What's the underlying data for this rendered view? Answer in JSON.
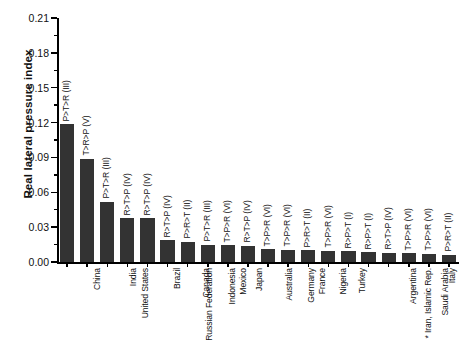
{
  "chart_data": {
    "type": "bar",
    "title": "",
    "xlabel": "",
    "ylabel": "Real lateral pressure index",
    "ylim": [
      0.0,
      0.21
    ],
    "ytick_step": 0.03,
    "yticks": [
      "0.00",
      "0.03",
      "0.06",
      "0.09",
      "0.12",
      "0.15",
      "0.18",
      "0.21"
    ],
    "grid": false,
    "legend": "none",
    "orientation": "vertical",
    "bar_color": "#333333",
    "categories": [
      "China",
      "United States",
      "India",
      "Russian Federation",
      "Brazil",
      "Canada",
      "Indonesia",
      "Mexico",
      "Japan",
      "Australia",
      "Germany",
      "France",
      "Nigeria",
      "Turkey",
      "* Iran, Islamic Rep.",
      "Argentina",
      "Saudi Arabia",
      "United Kingdom",
      "Italy",
      "Pakistan"
    ],
    "values": [
      0.1185,
      0.089,
      0.052,
      0.0378,
      0.0375,
      0.0188,
      0.0172,
      0.0148,
      0.0145,
      0.0142,
      0.011,
      0.0106,
      0.01,
      0.0098,
      0.0092,
      0.0085,
      0.008,
      0.0074,
      0.0072,
      0.006
    ],
    "annotations": [
      "P>T>R (III)",
      "T>R>P (V)",
      "P>T>R (III)",
      "R>T>P (IV)",
      "R>T>P (IV)",
      "R>T>P (IV)",
      "P>R>T (II)",
      "P>T>R (III)",
      "T>P>R (VI)",
      "R>T>P (IV)",
      "T>P>R (VI)",
      "T>P>R (VI)",
      "P>R>T (II)",
      "T>P>R (VI)",
      "R>P>T (I)",
      "R>P>T (I)",
      "R>T>P (IV)",
      "T>P>R (VI)",
      "T>P>R (VI)",
      "P>R>T (II)"
    ],
    "footnote_marker": "*"
  }
}
